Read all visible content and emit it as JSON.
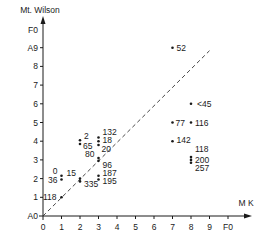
{
  "chart_data": {
    "type": "scatter",
    "title": "",
    "xlabel": "M K",
    "ylabel": "Mt. Wilson",
    "x_ticks": [
      "0",
      "1",
      "2",
      "3",
      "4",
      "5",
      "6",
      "7",
      "8",
      "9",
      "F0"
    ],
    "y_ticks": [
      "A0",
      "1",
      "2",
      "3",
      "4",
      "5",
      "6",
      "7",
      "8",
      "A9",
      "F0"
    ],
    "xlim": [
      0,
      10
    ],
    "ylim": [
      0,
      10
    ],
    "grid": false,
    "reference_line": {
      "style": "dashed",
      "from": [
        0,
        0
      ],
      "to": [
        9,
        9
      ],
      "label": "1:1"
    },
    "points": [
      {
        "x": 1,
        "y": 2.15,
        "label": "0"
      },
      {
        "x": 1,
        "y": 1.95,
        "label": "36"
      },
      {
        "x": 1,
        "y": 1,
        "label": "118"
      },
      {
        "x": 2,
        "y": 4.05,
        "label": "2"
      },
      {
        "x": 2,
        "y": 3.85,
        "label": "65"
      },
      {
        "x": 2,
        "y": 2.0,
        "label": "15"
      },
      {
        "x": 2,
        "y": 1.85,
        "label": "335"
      },
      {
        "x": 3,
        "y": 4.2,
        "label": "132"
      },
      {
        "x": 3,
        "y": 4.0,
        "label": "18"
      },
      {
        "x": 3,
        "y": 3.8,
        "label": "20"
      },
      {
        "x": 3,
        "y": 3.1,
        "label": "80"
      },
      {
        "x": 3,
        "y": 2.95,
        "label": "96"
      },
      {
        "x": 3,
        "y": 2.15,
        "label": "187"
      },
      {
        "x": 3,
        "y": 1.95,
        "label": "195"
      },
      {
        "x": 7,
        "y": 9,
        "label": "52"
      },
      {
        "x": 7,
        "y": 5,
        "label": "77"
      },
      {
        "x": 7,
        "y": 4,
        "label": "142"
      },
      {
        "x": 8,
        "y": 6,
        "label": "<45"
      },
      {
        "x": 8,
        "y": 5,
        "label": "116"
      },
      {
        "x": 8,
        "y": 3.15,
        "label": "118"
      },
      {
        "x": 8,
        "y": 3.0,
        "label": "200"
      },
      {
        "x": 8,
        "y": 2.85,
        "label": "257"
      }
    ]
  }
}
